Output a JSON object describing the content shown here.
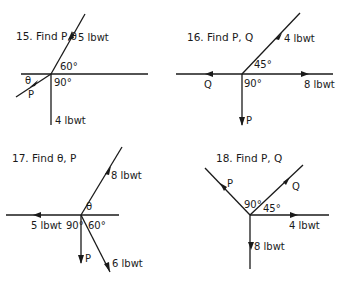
{
  "problems": [
    {
      "number": "15",
      "title": "15. Find P,θ",
      "forces": [
        {
          "label": "5 lbwt",
          "direction_deg": 60
        },
        {
          "label": "4 lbwt",
          "direction_deg": 270
        },
        {
          "label": "P",
          "direction_deg": 210
        }
      ],
      "angles": [
        "60°",
        "90°",
        "θ"
      ]
    },
    {
      "number": "16",
      "title": "16. Find P, Q",
      "forces": [
        {
          "label": "4 lbwt",
          "direction_deg": 45
        },
        {
          "label": "8 lbwt",
          "direction_deg": 0
        },
        {
          "label": "Q",
          "direction_deg": 180
        },
        {
          "label": "P",
          "direction_deg": 270
        }
      ],
      "angles": [
        "45°",
        "90°"
      ]
    },
    {
      "number": "17",
      "title": "17. Find θ, P",
      "forces": [
        {
          "label": "8 lbwt",
          "direction_deg": 60
        },
        {
          "label": "5 lbwt",
          "direction_deg": 180
        },
        {
          "label": "P",
          "direction_deg": 270
        },
        {
          "label": "6 lbwt",
          "direction_deg": 300
        }
      ],
      "angles": [
        "θ",
        "90°",
        "60°"
      ]
    },
    {
      "number": "18",
      "title": "18. Find P, Q",
      "forces": [
        {
          "label": "P",
          "direction_deg": 135
        },
        {
          "label": "Q",
          "direction_deg": 45
        },
        {
          "label": "4 lbwt",
          "direction_deg": 0
        },
        {
          "label": "8 lbwt",
          "direction_deg": 270
        }
      ],
      "angles": [
        "90°",
        "45°"
      ]
    }
  ],
  "labels": {
    "p15_title": "15. Find P,θ",
    "p15_f1": "5 lbwt",
    "p15_f2": "4 lbwt",
    "p15_f3": "P",
    "p15_a1": "60°",
    "p15_a2": "90°",
    "p15_a3": "θ",
    "p16_title": "16. Find  P, Q",
    "p16_f1": "4 lbwt",
    "p16_f2": "8 lbwt",
    "p16_f3": "Q",
    "p16_f4": "P",
    "p16_a1": "45°",
    "p16_a2": "90°",
    "p17_title": "17. Find  θ, P",
    "p17_f1": "8 lbwt",
    "p17_f2": "5 lbwt",
    "p17_f3": "P",
    "p17_f4": "6 lbwt",
    "p17_a1": "θ",
    "p17_a2": "90°",
    "p17_a3": "60°",
    "p18_title": "18. Find  P, Q",
    "p18_f1": "P",
    "p18_f2": "Q",
    "p18_f3": "4 lbwt",
    "p18_f4": "8 lbwt",
    "p18_a1": "90°",
    "p18_a2": "45°"
  }
}
